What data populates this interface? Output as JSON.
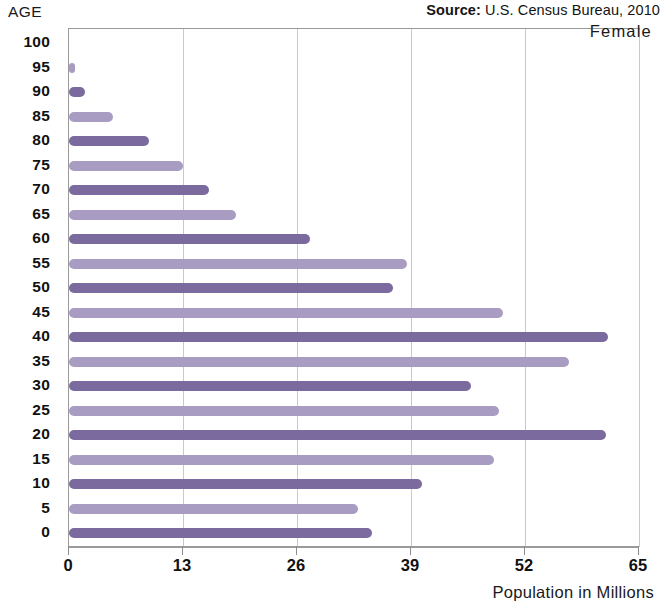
{
  "source": {
    "label": "Source:",
    "text": " U.S. Census Bureau, 2010"
  },
  "axis_caption": "AGE",
  "series_label": "Female",
  "colors": {
    "bar_dark": "#7a6a9e",
    "bar_light": "#a99cc2",
    "grid": "#c9c9c9",
    "axis": "#9a9a9a"
  },
  "chart_data": {
    "type": "bar",
    "orientation": "horizontal",
    "title": "",
    "subtitle": "",
    "xlabel": "Population in Millions",
    "ylabel": "AGE",
    "xlim": [
      0,
      65
    ],
    "ylim": [
      0,
      100
    ],
    "xticks": [
      0,
      13,
      26,
      39,
      52,
      65
    ],
    "xticklabels": [
      "0",
      "13",
      "26",
      "39",
      "52",
      "65"
    ],
    "yticks": [
      0,
      5,
      10,
      15,
      20,
      25,
      30,
      35,
      40,
      45,
      50,
      55,
      60,
      65,
      70,
      75,
      80,
      85,
      90,
      95,
      100
    ],
    "yticklabels": [
      "0",
      "5",
      "10",
      "15",
      "20",
      "25",
      "30",
      "35",
      "40",
      "45",
      "50",
      "55",
      "60",
      "65",
      "70",
      "75",
      "80",
      "85",
      "90",
      "95",
      "100"
    ],
    "grid": true,
    "legend": [
      "Female"
    ],
    "legend_position": "top-right",
    "annotations": [
      "Source: U.S. Census Bureau, 2010"
    ],
    "categories": [
      "0",
      "5",
      "10",
      "15",
      "20",
      "25",
      "30",
      "35",
      "40",
      "45",
      "50",
      "55",
      "60",
      "65",
      "70",
      "75",
      "80",
      "85",
      "90",
      "95",
      "100"
    ],
    "values": [
      34.5,
      33.0,
      40.2,
      48.5,
      61.2,
      49.0,
      45.8,
      57.0,
      61.5,
      49.5,
      37.0,
      38.5,
      27.5,
      19.0,
      16.0,
      13.0,
      9.1,
      5.0,
      1.8,
      0.7,
      0.0
    ],
    "bars": [
      {
        "age": "100",
        "value": 0.0,
        "shade": "dark"
      },
      {
        "age": "95",
        "value": 0.7,
        "shade": "light"
      },
      {
        "age": "90",
        "value": 1.8,
        "shade": "dark"
      },
      {
        "age": "85",
        "value": 5.0,
        "shade": "light"
      },
      {
        "age": "80",
        "value": 9.1,
        "shade": "dark"
      },
      {
        "age": "75",
        "value": 13.0,
        "shade": "light"
      },
      {
        "age": "70",
        "value": 16.0,
        "shade": "dark"
      },
      {
        "age": "65",
        "value": 19.0,
        "shade": "light"
      },
      {
        "age": "60",
        "value": 27.5,
        "shade": "dark"
      },
      {
        "age": "55",
        "value": 38.5,
        "shade": "light"
      },
      {
        "age": "50",
        "value": 37.0,
        "shade": "dark"
      },
      {
        "age": "45",
        "value": 49.5,
        "shade": "light"
      },
      {
        "age": "40",
        "value": 61.5,
        "shade": "dark"
      },
      {
        "age": "35",
        "value": 57.0,
        "shade": "light"
      },
      {
        "age": "30",
        "value": 45.8,
        "shade": "dark"
      },
      {
        "age": "25",
        "value": 49.0,
        "shade": "light"
      },
      {
        "age": "20",
        "value": 61.2,
        "shade": "dark"
      },
      {
        "age": "15",
        "value": 48.5,
        "shade": "light"
      },
      {
        "age": "10",
        "value": 40.2,
        "shade": "dark"
      },
      {
        "age": "5",
        "value": 33.0,
        "shade": "light"
      },
      {
        "age": "0",
        "value": 34.5,
        "shade": "dark"
      }
    ]
  }
}
